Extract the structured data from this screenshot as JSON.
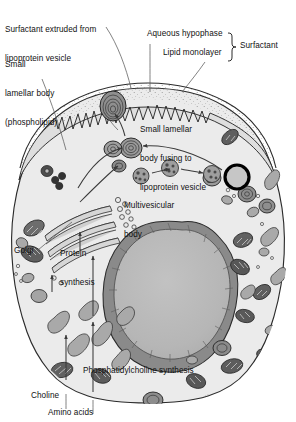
{
  "figure": {
    "type": "biological-cell-diagram",
    "colors": {
      "cytoplasm": "#ebebeb",
      "nucleoplasm": "#b8b8b8",
      "nuclear_envelope": "#8a8a8a",
      "organelle_fill": "#a8a8a8",
      "organelle_dark": "#5a5a5a",
      "outline": "#2b2b2b",
      "label_text": "#111111",
      "leader_line": "#555555",
      "background": "#ffffff"
    }
  },
  "labels": {
    "surfactant_extruded": {
      "line1": "Surfactant extruded from",
      "line2": "lipoprotein vesicle"
    },
    "small_lamellar_body": {
      "line1": "Small",
      "line2": "lamellar body",
      "line3": "(phospholipid)"
    },
    "aqueous_hypophase": "Aqueous hypophase",
    "lipid_monolayer": "Lipid monolayer",
    "surfactant_bracket": "Surfactant",
    "fusing_body": {
      "line1": "Small lamellar",
      "line2": "body fusing to",
      "line3": "lipoprotein vesicle"
    },
    "multivesicular_body": {
      "line1": "Multivesicular",
      "line2": "body"
    },
    "golgi": "Golgi",
    "protein_synthesis": {
      "line1": "Protein",
      "line2": "synthesis"
    },
    "phosphatidylcholine_synthesis": "Phosphatidylcholine synthesis",
    "choline": "Choline",
    "amino_acids": "Amino acids"
  },
  "structures": {
    "cell_membrane": "cell-outline",
    "microvilli": "apical-microvilli",
    "nucleus": "nucleus",
    "golgi_stack": "golgi-apparatus",
    "mitochondria_count": 14,
    "lamellar_bodies_count": 9,
    "vesicles_count": 12,
    "arrows_count": 10
  }
}
